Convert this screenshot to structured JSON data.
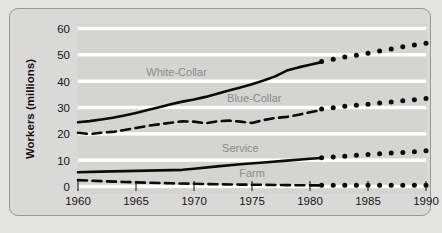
{
  "chart_data": {
    "type": "line",
    "title": "",
    "subtitle": "",
    "xlabel": "",
    "ylabel": "Workers (millions)",
    "xlim": [
      1960,
      1990
    ],
    "ylim": [
      0,
      60
    ],
    "x_ticks": [
      1960,
      1965,
      1970,
      1975,
      1980,
      1985,
      1990
    ],
    "y_ticks": [
      0,
      10,
      20,
      30,
      40,
      50,
      60
    ],
    "grid": "horizontal-white-bands",
    "legend": "inline-labels",
    "projection_start_year": 1981,
    "series": [
      {
        "name": "White-Collar",
        "style": "solid",
        "projection_style": "dotted",
        "label_x": 1968.5,
        "label_y": 42.5,
        "x": [
          1960,
          1961,
          1962,
          1963,
          1964,
          1965,
          1966,
          1967,
          1968,
          1969,
          1970,
          1971,
          1972,
          1973,
          1974,
          1975,
          1976,
          1977,
          1978,
          1979,
          1980,
          1981
        ],
        "values": [
          25.0,
          25.4,
          26.0,
          26.7,
          27.5,
          28.5,
          29.6,
          30.7,
          31.8,
          32.8,
          33.6,
          34.6,
          35.8,
          37.0,
          38.2,
          39.4,
          40.8,
          42.4,
          44.6,
          45.8,
          46.8,
          47.8
        ],
        "projection_x": [
          1981,
          1982,
          1983,
          1984,
          1985,
          1986,
          1987,
          1988,
          1989,
          1990
        ],
        "projection_values": [
          48.0,
          48.9,
          49.7,
          50.4,
          51.2,
          52.0,
          52.8,
          53.6,
          54.3,
          55.0
        ]
      },
      {
        "name": "Blue-Collar",
        "style": "dashed",
        "projection_style": "dotted",
        "label_x": 1975.2,
        "label_y": 32.8,
        "x": [
          1960,
          1961,
          1962,
          1963,
          1964,
          1965,
          1966,
          1967,
          1968,
          1969,
          1970,
          1971,
          1972,
          1973,
          1974,
          1975,
          1976,
          1977,
          1978,
          1979,
          1980,
          1981
        ],
        "values": [
          21.0,
          20.5,
          21.0,
          21.3,
          22.0,
          22.8,
          23.6,
          24.2,
          24.8,
          25.3,
          25.2,
          24.6,
          25.3,
          25.6,
          25.2,
          24.7,
          25.8,
          26.6,
          27.0,
          27.8,
          28.8,
          29.6
        ],
        "projection_x": [
          1981,
          1982,
          1983,
          1984,
          1985,
          1986,
          1987,
          1988,
          1989,
          1990
        ],
        "projection_values": [
          30.0,
          30.5,
          31.0,
          31.4,
          31.8,
          32.3,
          32.7,
          33.1,
          33.5,
          34.0
        ]
      },
      {
        "name": "Service",
        "style": "solid",
        "projection_style": "dotted",
        "label_x": 1974.0,
        "label_y": 13.6,
        "x": [
          1960,
          1962,
          1964,
          1966,
          1968,
          1969,
          1970,
          1972,
          1974,
          1976,
          1978,
          1980,
          1981
        ],
        "values": [
          6.0,
          6.2,
          6.4,
          6.6,
          6.8,
          6.9,
          7.3,
          8.2,
          9.0,
          9.7,
          10.4,
          11.1,
          11.4
        ],
        "projection_x": [
          1981,
          1982,
          1983,
          1984,
          1985,
          1986,
          1987,
          1988,
          1989,
          1990
        ],
        "projection_values": [
          11.5,
          11.8,
          12.1,
          12.4,
          12.7,
          13.0,
          13.3,
          13.5,
          13.8,
          14.1
        ]
      },
      {
        "name": "Farm",
        "style": "dashed",
        "projection_style": "dotted",
        "label_x": 1975.0,
        "label_y": 4.3,
        "x": [
          1960,
          1962,
          1964,
          1966,
          1968,
          1970,
          1972,
          1974,
          1976,
          1978,
          1980,
          1981
        ],
        "values": [
          3.0,
          2.6,
          2.3,
          2.0,
          1.8,
          1.6,
          1.4,
          1.3,
          1.2,
          1.1,
          1.0,
          1.0
        ],
        "projection_x": [
          1981,
          1982,
          1983,
          1984,
          1985,
          1986,
          1987,
          1988,
          1989,
          1990
        ],
        "projection_values": [
          1.0,
          1.0,
          1.0,
          1.0,
          1.0,
          1.0,
          1.0,
          1.0,
          1.0,
          1.0
        ]
      }
    ],
    "colors": {
      "line": "#0b0b0b",
      "panel_bg": "#d9d9d7",
      "plot_bg": "#d4d4d2",
      "gridband": "#ffffff",
      "label_text": "#8a8a88",
      "tick_text": "#151515",
      "panel_border": "#9a9a98"
    }
  }
}
